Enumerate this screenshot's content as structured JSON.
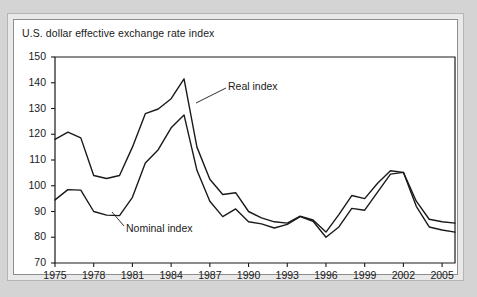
{
  "chart_data": {
    "type": "line",
    "title": "U.S. dollar effective exchange rate index",
    "xlabel": "",
    "ylabel": "",
    "xlim": [
      1975,
      2006
    ],
    "ylim": [
      70,
      150
    ],
    "ytick_step": 10,
    "xtick_step": 3,
    "grid": false,
    "legend": "inline-annotations",
    "yticks": [
      "150",
      "140",
      "130",
      "120",
      "110",
      "100",
      "90",
      "80",
      "70"
    ],
    "xticks": [
      "1975",
      "1978",
      "1981",
      "1984",
      "1987",
      "1990",
      "1993",
      "1996",
      "1999",
      "2002",
      "2005"
    ],
    "x": [
      1975,
      1976,
      1977,
      1978,
      1979,
      1980,
      1981,
      1982,
      1983,
      1984,
      1985,
      1986,
      1987,
      1988,
      1989,
      1990,
      1991,
      1992,
      1993,
      1994,
      1995,
      1996,
      1997,
      1998,
      1999,
      2000,
      2001,
      2002,
      2003,
      2004,
      2005,
      2006
    ],
    "series": [
      {
        "name": "Real index",
        "label": "Real index",
        "color": "#1a1a1a",
        "values": [
          118.0,
          120.8,
          118.6,
          104.0,
          102.8,
          104.0,
          115.0,
          128.0,
          129.8,
          133.8,
          141.5,
          115.0,
          102.5,
          96.6,
          97.3,
          90.0,
          87.5,
          86.0,
          85.5,
          88.2,
          86.7,
          82.0,
          88.8,
          96.2,
          95.0,
          101.0,
          105.8,
          105.2,
          94.0,
          87.0,
          86.0,
          85.5
        ]
      },
      {
        "name": "Nominal index",
        "label": "Nominal index",
        "color": "#1a1a1a",
        "values": [
          94.5,
          98.5,
          98.3,
          90.0,
          88.6,
          88.4,
          95.5,
          108.8,
          114.0,
          122.5,
          127.5,
          106.0,
          94.0,
          88.0,
          91.0,
          86.0,
          85.2,
          83.6,
          85.0,
          88.0,
          86.2,
          80.0,
          84.0,
          91.2,
          90.5,
          97.5,
          104.5,
          105.2,
          92.0,
          84.0,
          82.8,
          82.0
        ]
      }
    ],
    "annotations": [
      {
        "name": "real-index-annotation",
        "text": "Real index",
        "x_px": 228,
        "y_px": 86
      },
      {
        "name": "nominal-index-annotation",
        "text": "Nominal index",
        "x_px": 124,
        "y_px": 228
      }
    ]
  },
  "layout": {
    "plot_left_px": 55,
    "plot_right_px": 455,
    "plot_top_px": 57,
    "plot_bottom_px": 263
  }
}
